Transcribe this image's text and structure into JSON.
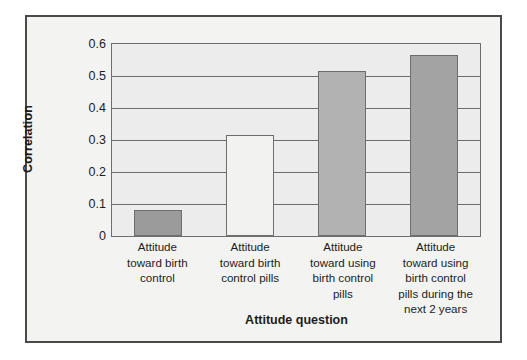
{
  "figure": {
    "background": "#f3f3f1",
    "border_color": "#4a4a4a",
    "plot_background": "#ececec",
    "axis_color": "#6e6e6e"
  },
  "chart_data": {
    "type": "bar",
    "title": "",
    "subtitle": "",
    "xlabel": "Attitude question",
    "ylabel": "Correlation",
    "ylim": [
      0,
      0.6
    ],
    "yticks": [
      "0",
      "0.1",
      "0.2",
      "0.3",
      "0.4",
      "0.5",
      "0.6"
    ],
    "ytick_values": [
      0,
      0.1,
      0.2,
      0.3,
      0.4,
      0.5,
      0.6
    ],
    "grid": true,
    "grid_axis": "y",
    "legend": null,
    "categories": [
      "Attitude toward birth control",
      "Attitude toward birth control pills",
      "Attitude toward using birth control pills",
      "Attitude toward using birth control pills during the next 2 years"
    ],
    "category_lines": [
      [
        "Attitude",
        "toward birth",
        "control"
      ],
      [
        "Attitude",
        "toward birth",
        "control pills"
      ],
      [
        "Attitude",
        "toward using",
        "birth control",
        "pills"
      ],
      [
        "Attitude",
        "toward using",
        "birth control",
        "pills during the",
        "next 2 years"
      ]
    ],
    "values": [
      0.08,
      0.317,
      0.515,
      0.565
    ],
    "bar_colors": [
      "#9b9b9b",
      "#f2f2f0",
      "#b2b2b2",
      "#a3a3a3"
    ],
    "bar_edge_color": "#6e6e6e"
  }
}
